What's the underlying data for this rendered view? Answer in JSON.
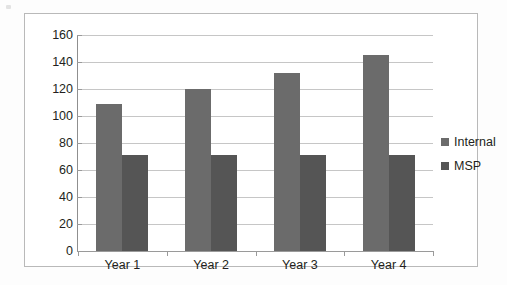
{
  "chart_data": {
    "type": "bar",
    "title": "",
    "subtitle": "",
    "xlabel": "",
    "ylabel": "",
    "categories": [
      "Year 1",
      "Year 2",
      "Year 3",
      "Year 4"
    ],
    "series": [
      {
        "name": "Internal",
        "values": [
          109,
          120,
          132,
          145
        ],
        "color": "#6b6b6b"
      },
      {
        "name": "MSP",
        "values": [
          71,
          71,
          71,
          71
        ],
        "color": "#555555"
      }
    ],
    "ylim": [
      0,
      160
    ],
    "ytick_step": 20,
    "yticks": [
      0,
      20,
      40,
      60,
      80,
      100,
      120,
      140,
      160
    ],
    "ytick_labels": [
      "0",
      "20",
      "40",
      "60",
      "80",
      "100",
      "120",
      "140",
      "160"
    ],
    "grid": true,
    "grid_axis": "y",
    "legend": true,
    "legend_position": "right",
    "legend_entries": [
      "Internal",
      "MSP"
    ],
    "annotations": []
  },
  "frame": {
    "border_color": "#b9b9b9",
    "background": "#ffffff",
    "page_background": "#fdfdfd"
  }
}
